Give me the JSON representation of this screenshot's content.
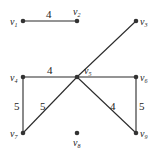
{
  "graph": {
    "nodes": [
      {
        "id": "v1",
        "name": "v",
        "sub": "1",
        "x": 23,
        "y": 21,
        "lx": 10,
        "ly": 25
      },
      {
        "id": "v2",
        "name": "v",
        "sub": "2",
        "x": 77,
        "y": 21,
        "lx": 73,
        "ly": 15
      },
      {
        "id": "v3",
        "name": "v",
        "sub": "3",
        "x": 136,
        "y": 21,
        "lx": 140,
        "ly": 25
      },
      {
        "id": "v4",
        "name": "v",
        "sub": "4",
        "x": 23,
        "y": 77,
        "lx": 10,
        "ly": 81
      },
      {
        "id": "v5",
        "name": "v",
        "sub": "5",
        "x": 77,
        "y": 77,
        "lx": 84,
        "ly": 74
      },
      {
        "id": "v6",
        "name": "v",
        "sub": "6",
        "x": 136,
        "y": 77,
        "lx": 140,
        "ly": 81
      },
      {
        "id": "v7",
        "name": "v",
        "sub": "7",
        "x": 23,
        "y": 133,
        "lx": 10,
        "ly": 137
      },
      {
        "id": "v8",
        "name": "v",
        "sub": "8",
        "x": 77,
        "y": 133,
        "lx": 73,
        "ly": 146
      },
      {
        "id": "v9",
        "name": "v",
        "sub": "9",
        "x": 136,
        "y": 133,
        "lx": 140,
        "ly": 137
      }
    ],
    "edges": [
      {
        "from": "v1",
        "to": "v2",
        "weight": "4",
        "wx": 46,
        "wy": 18
      },
      {
        "from": "v5",
        "to": "v3",
        "weight": "",
        "wx": 0,
        "wy": 0
      },
      {
        "from": "v4",
        "to": "v5",
        "weight": "4",
        "wx": 47,
        "wy": 74
      },
      {
        "from": "v5",
        "to": "v6",
        "weight": "",
        "wx": 0,
        "wy": 0
      },
      {
        "from": "v4",
        "to": "v7",
        "weight": "5",
        "wx": 14,
        "wy": 110
      },
      {
        "from": "v5",
        "to": "v7",
        "weight": "5",
        "wx": 40,
        "wy": 110
      },
      {
        "from": "v5",
        "to": "v9",
        "weight": "4",
        "wx": 110,
        "wy": 110
      },
      {
        "from": "v6",
        "to": "v9",
        "weight": "5",
        "wx": 139,
        "wy": 110
      }
    ]
  }
}
